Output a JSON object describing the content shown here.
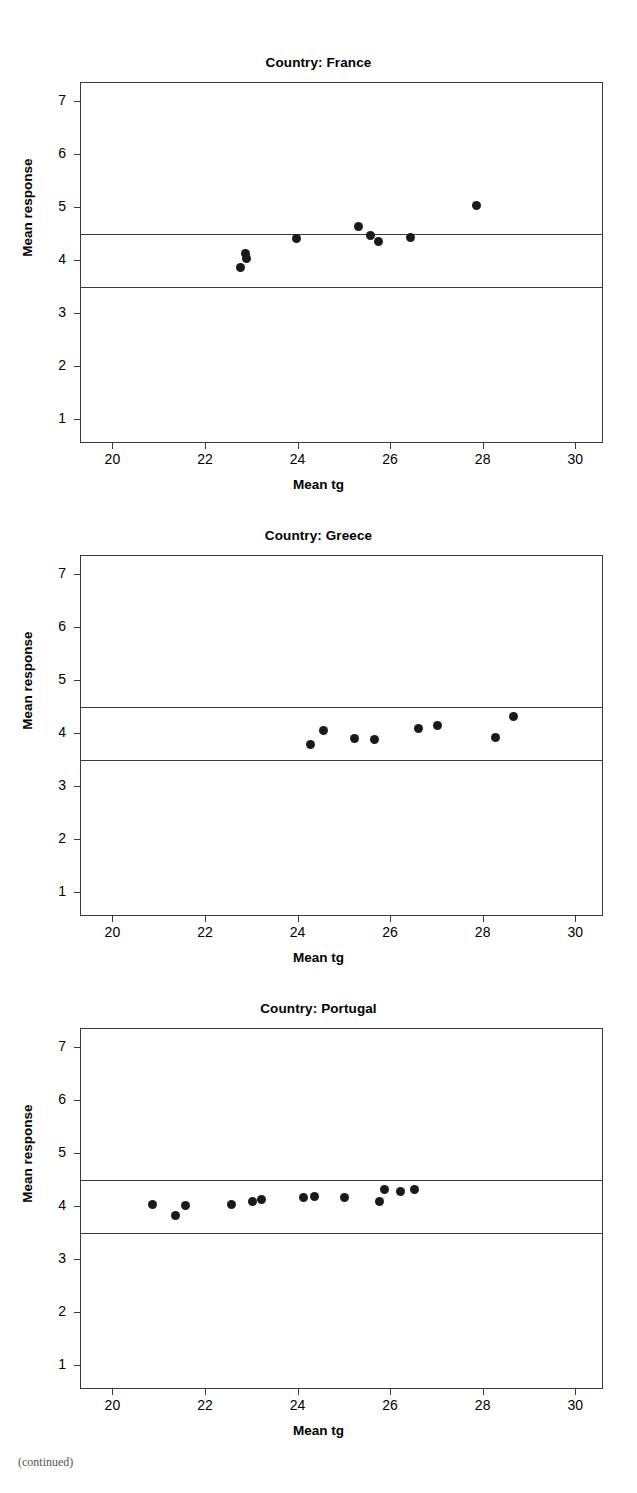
{
  "figure": {
    "axis_titles": {
      "x": "Mean tg",
      "y": "Mean response"
    },
    "xlim": [
      19.3,
      30.6
    ],
    "ylim": [
      0.55,
      7.35
    ],
    "xticks": [
      20,
      22,
      24,
      26,
      28,
      30
    ],
    "yticks": [
      1,
      2,
      3,
      4,
      5,
      6,
      7
    ],
    "reference_lines": [
      4.5,
      3.5
    ],
    "marker_color": "#1a1a1a",
    "frame_color": "#3a3a3a"
  },
  "chart_data": [
    {
      "type": "scatter",
      "title": "Country: France",
      "xlabel": "Mean tg",
      "ylabel": "Mean response",
      "xlim": [
        19.3,
        30.6
      ],
      "ylim": [
        0.55,
        7.35
      ],
      "xticks": [
        20,
        22,
        24,
        26,
        28,
        30
      ],
      "yticks": [
        1,
        2,
        3,
        4,
        5,
        6,
        7
      ],
      "grid": false,
      "legend": "none",
      "reference_lines": [
        4.5,
        3.5
      ],
      "points": [
        {
          "x": 22.75,
          "y": 3.88
        },
        {
          "x": 22.85,
          "y": 4.13
        },
        {
          "x": 22.88,
          "y": 4.05
        },
        {
          "x": 23.95,
          "y": 4.43
        },
        {
          "x": 25.3,
          "y": 4.65
        },
        {
          "x": 25.55,
          "y": 4.47
        },
        {
          "x": 25.72,
          "y": 4.37
        },
        {
          "x": 26.42,
          "y": 4.44
        },
        {
          "x": 27.85,
          "y": 5.04
        }
      ]
    },
    {
      "type": "scatter",
      "title": "Country: Greece",
      "xlabel": "Mean tg",
      "ylabel": "Mean response",
      "xlim": [
        19.3,
        30.6
      ],
      "ylim": [
        0.55,
        7.35
      ],
      "xticks": [
        20,
        22,
        24,
        26,
        28,
        30
      ],
      "yticks": [
        1,
        2,
        3,
        4,
        5,
        6,
        7
      ],
      "grid": false,
      "legend": "none",
      "reference_lines": [
        4.5,
        3.5
      ],
      "points": [
        {
          "x": 24.25,
          "y": 3.79
        },
        {
          "x": 24.55,
          "y": 4.06
        },
        {
          "x": 25.2,
          "y": 3.92
        },
        {
          "x": 25.65,
          "y": 3.89
        },
        {
          "x": 26.6,
          "y": 4.1
        },
        {
          "x": 27.0,
          "y": 4.15
        },
        {
          "x": 28.25,
          "y": 3.93
        },
        {
          "x": 28.65,
          "y": 4.32
        }
      ]
    },
    {
      "type": "scatter",
      "title": "Country: Portugal",
      "xlabel": "Mean tg",
      "ylabel": "Mean response",
      "xlim": [
        19.3,
        30.6
      ],
      "ylim": [
        0.55,
        7.35
      ],
      "xticks": [
        20,
        22,
        24,
        26,
        28,
        30
      ],
      "yticks": [
        1,
        2,
        3,
        4,
        5,
        6,
        7
      ],
      "grid": false,
      "legend": "none",
      "reference_lines": [
        4.5,
        3.5
      ],
      "points": [
        {
          "x": 20.85,
          "y": 4.05
        },
        {
          "x": 21.35,
          "y": 3.83
        },
        {
          "x": 21.55,
          "y": 4.02
        },
        {
          "x": 22.55,
          "y": 4.04
        },
        {
          "x": 23.0,
          "y": 4.11
        },
        {
          "x": 23.2,
          "y": 4.14
        },
        {
          "x": 24.1,
          "y": 4.18
        },
        {
          "x": 24.35,
          "y": 4.2
        },
        {
          "x": 25.0,
          "y": 4.17
        },
        {
          "x": 25.75,
          "y": 4.1
        },
        {
          "x": 25.85,
          "y": 4.33
        },
        {
          "x": 26.2,
          "y": 4.28
        },
        {
          "x": 26.5,
          "y": 4.32
        }
      ]
    }
  ],
  "page": {
    "corner_mark": "(continued)"
  }
}
